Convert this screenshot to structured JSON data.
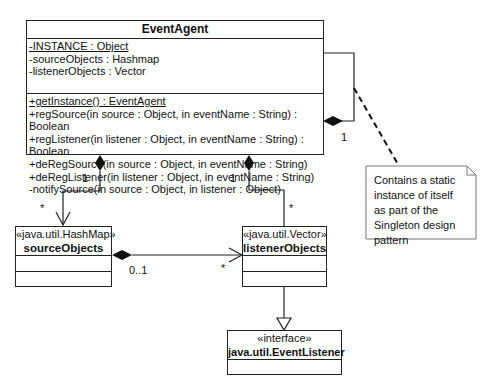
{
  "event_agent": {
    "name": "EventAgent",
    "attributes": [
      {
        "text": "-INSTANCE : Object",
        "static": true
      },
      {
        "text": "-sourceObjects : Hashmap",
        "static": false
      },
      {
        "text": "-listenerObjects : Vector",
        "static": false
      }
    ],
    "operations": [
      {
        "text": "+getInstance() : EventAgent",
        "static": true
      },
      {
        "text": "+regSource(in source : Object, in eventName : String) : Boolean",
        "static": false
      },
      {
        "text": "+regListener(in listener : Object, in eventName : String) : Boolean",
        "static": false
      },
      {
        "text": "+deRegSource(in source : Object, in eventName : String)",
        "static": false
      },
      {
        "text": "+deRegListener(in listener : Object, in eventName : String)",
        "static": false
      },
      {
        "text": "-notifySource(in source : Object, in listener : Object)",
        "static": false
      }
    ]
  },
  "source_objects": {
    "stereotype": "«java.util.HashMap»",
    "name": "sourceObjects"
  },
  "listener_objects": {
    "stereotype": "«java.util.Vector»",
    "name": "listenerObjects"
  },
  "event_listener": {
    "stereotype": "«interface»",
    "name": "java.util.EventListener"
  },
  "multiplicities": {
    "self_loop": "1",
    "agent_to_source_owner": "1",
    "agent_to_source_part": "*",
    "agent_to_listener_owner": "1",
    "agent_to_listener_part": "*",
    "source_to_listener_owner": "0..1",
    "source_to_listener_part": "*"
  },
  "note": {
    "text": "Contains a static instance of itself as part of the Singleton design pattern"
  }
}
